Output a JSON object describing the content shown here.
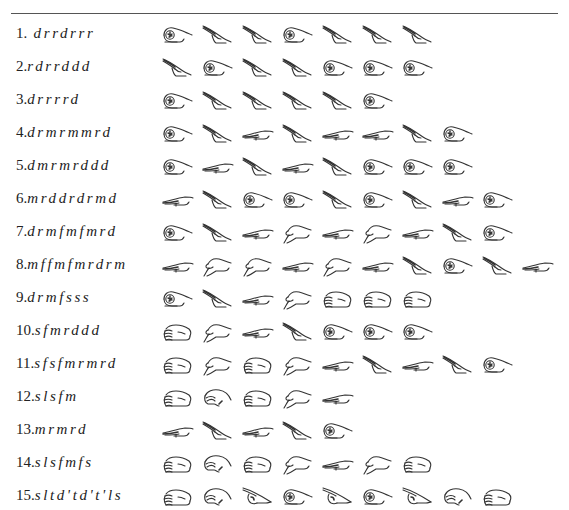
{
  "figure": {
    "title_rule": true,
    "legend": {
      "d": "fist",
      "r": "flat-hand-slanted-up",
      "m": "flat-hand-horizontal",
      "f": "thumb-down",
      "s": "palm-facing",
      "l": "drooping-hand",
      "t": "pointing-up",
      "d'": "fist",
      "t'": "pointing-up"
    },
    "exercises": [
      {
        "num": "1.",
        "seq": "d r r d r r r",
        "notes": [
          "d",
          "r",
          "r",
          "d",
          "r",
          "r",
          "r"
        ]
      },
      {
        "num": "2.",
        "seq": "r d r r d d d",
        "notes": [
          "r",
          "d",
          "r",
          "r",
          "d",
          "d",
          "d"
        ]
      },
      {
        "num": "3.",
        "seq": "d r r r r d",
        "notes": [
          "d",
          "r",
          "r",
          "r",
          "r",
          "d"
        ]
      },
      {
        "num": "4.",
        "seq": "d r m r m m r d",
        "notes": [
          "d",
          "r",
          "m",
          "r",
          "m",
          "m",
          "r",
          "d"
        ]
      },
      {
        "num": "5.",
        "seq": "d m r m r d d d",
        "notes": [
          "d",
          "m",
          "r",
          "m",
          "r",
          "d",
          "d",
          "d"
        ]
      },
      {
        "num": "6.",
        "seq": "m r d d r d r m d",
        "notes": [
          "m",
          "r",
          "d",
          "d",
          "r",
          "d",
          "r",
          "m",
          "d"
        ]
      },
      {
        "num": "7.",
        "seq": "d r m f m f m r d",
        "notes": [
          "d",
          "r",
          "m",
          "f",
          "m",
          "f",
          "m",
          "r",
          "d"
        ]
      },
      {
        "num": "8.",
        "seq": "m f f m f m r d r m",
        "notes": [
          "m",
          "f",
          "f",
          "m",
          "f",
          "m",
          "r",
          "d",
          "r",
          "m"
        ]
      },
      {
        "num": "9.",
        "seq": "d r m f s s s",
        "notes": [
          "d",
          "r",
          "m",
          "f",
          "s",
          "s",
          "s"
        ]
      },
      {
        "num": "10.",
        "seq": "s f m r d d d",
        "notes": [
          "s",
          "f",
          "m",
          "r",
          "d",
          "d",
          "d"
        ]
      },
      {
        "num": "11.",
        "seq": "s f s f m r m r d",
        "notes": [
          "s",
          "f",
          "s",
          "f",
          "m",
          "r",
          "m",
          "r",
          "d"
        ]
      },
      {
        "num": "12.",
        "seq": "s l s f m",
        "notes": [
          "s",
          "l",
          "s",
          "f",
          "m"
        ]
      },
      {
        "num": "13.",
        "seq": "m r m r d",
        "notes": [
          "m",
          "r",
          "m",
          "r",
          "d"
        ]
      },
      {
        "num": "14.",
        "seq": "s l s f m f s",
        "notes": [
          "s",
          "l",
          "s",
          "f",
          "m",
          "f",
          "s"
        ]
      },
      {
        "num": "15.",
        "seq": "s l t d' t d' t' l s",
        "notes": [
          "s",
          "l",
          "t",
          "d'",
          "t",
          "d'",
          "t",
          "l",
          "s"
        ]
      }
    ]
  }
}
